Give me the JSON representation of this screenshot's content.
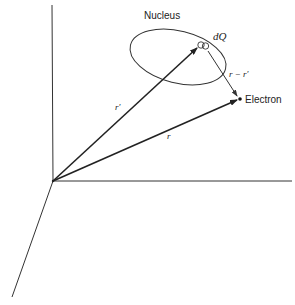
{
  "diagram": {
    "labels": {
      "nucleus": "Nucleus",
      "charge_element": "dQ",
      "r_prime": "r′",
      "r_minus_r_prime": "r − r′",
      "electron": "Electron",
      "r": "r"
    },
    "colors": {
      "line": "#222222",
      "background": "#ffffff"
    },
    "nodes": [
      {
        "id": "origin",
        "x": 53,
        "y": 181
      },
      {
        "id": "dQ",
        "x": 203,
        "y": 46
      },
      {
        "id": "electron",
        "x": 240,
        "y": 99
      }
    ],
    "edges": [
      {
        "from": "origin",
        "to": "dQ",
        "label": "r′",
        "arrow": true
      },
      {
        "from": "origin",
        "to": "electron",
        "label": "r",
        "arrow": true
      },
      {
        "from": "dQ",
        "to": "electron",
        "label": "r − r′",
        "arrow": true
      }
    ],
    "axes": [
      "vertical",
      "horizontal",
      "diagonal"
    ]
  }
}
